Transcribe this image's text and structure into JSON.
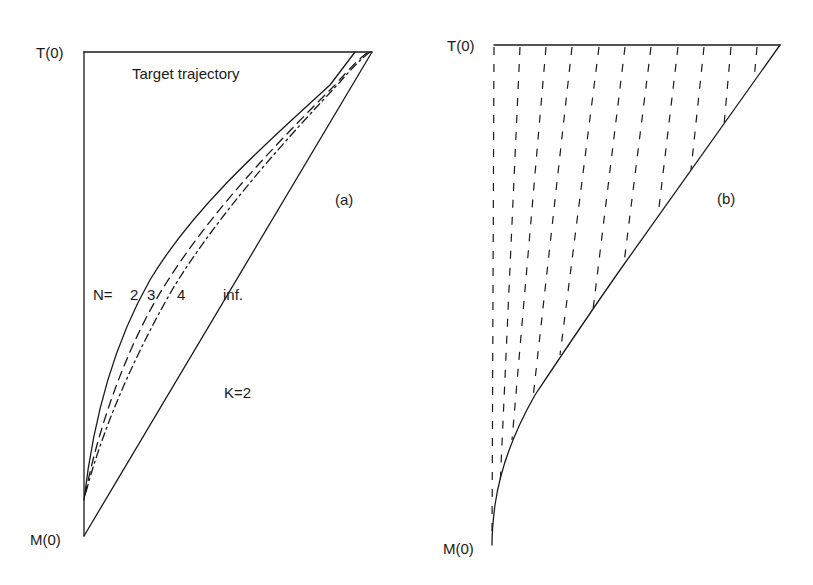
{
  "figure": {
    "panel_a": {
      "tag": "(a)",
      "top_label": "T(0)",
      "bottom_label": "M(0)",
      "title": "Target trajectory",
      "n_prefix": "N=",
      "n_values": [
        "2",
        "3",
        "4",
        "inf."
      ],
      "k_label": "K=2",
      "curves": [
        {
          "name": "N=2",
          "style": "solid"
        },
        {
          "name": "N=3",
          "style": "dashed"
        },
        {
          "name": "N=4",
          "style": "dash-dot"
        },
        {
          "name": "N=inf.",
          "style": "solid-straight"
        }
      ]
    },
    "panel_b": {
      "tag": "(b)",
      "top_label": "T(0)",
      "bottom_label": "M(0)",
      "hatch_line_count": 11
    },
    "colors": {
      "ink": "#1a1a1a",
      "background": "#ffffff"
    }
  }
}
